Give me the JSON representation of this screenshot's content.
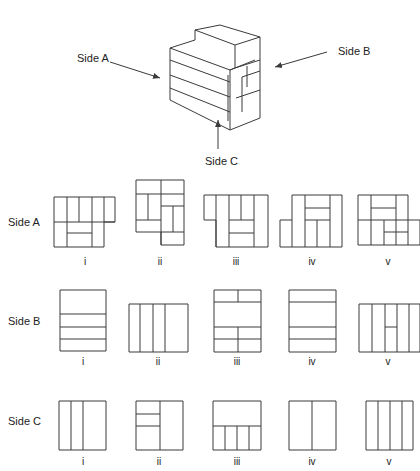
{
  "diagram": {
    "cube": {
      "labels": [
        {
          "id": "side-a",
          "text": "Side A",
          "x": 77,
          "y": 62
        },
        {
          "id": "side-b",
          "text": "Side B",
          "x": 338,
          "y": 55
        },
        {
          "id": "side-c",
          "text": "Side C",
          "x": 205,
          "y": 165
        }
      ],
      "arrows": [
        {
          "id": "arrow-side-a",
          "x1": 110,
          "y1": 62,
          "x2": 160,
          "y2": 78
        },
        {
          "id": "arrow-side-b",
          "x1": 327,
          "y1": 52,
          "x2": 275,
          "y2": 67
        },
        {
          "id": "arrow-side-c",
          "x1": 218,
          "y1": 149,
          "x2": 218,
          "y2": 120
        }
      ],
      "lines": [
        [
          170,
          48,
          230,
          70
        ],
        [
          230,
          70,
          230,
          130
        ],
        [
          170,
          48,
          170,
          100
        ],
        [
          170,
          100,
          230,
          130
        ],
        [
          170,
          60,
          230,
          82
        ],
        [
          170,
          75,
          230,
          97
        ],
        [
          170,
          88,
          230,
          112
        ],
        [
          230,
          70,
          255,
          60
        ],
        [
          230,
          130,
          260,
          118
        ],
        [
          260,
          118,
          260,
          37
        ],
        [
          170,
          48,
          195,
          40
        ],
        [
          195,
          40,
          195,
          30
        ],
        [
          195,
          30,
          220,
          25
        ],
        [
          220,
          25,
          260,
          37
        ],
        [
          195,
          30,
          235,
          45
        ],
        [
          235,
          45,
          260,
          37
        ],
        [
          235,
          45,
          235,
          68
        ],
        [
          230,
          70,
          235,
          68
        ],
        [
          235,
          68,
          260,
          60
        ],
        [
          242,
          77,
          260,
          71
        ],
        [
          236,
          98,
          260,
          90
        ],
        [
          247,
          66,
          247,
          87
        ],
        [
          242,
          77,
          242,
          112
        ],
        [
          228,
          121,
          228,
          75
        ]
      ]
    },
    "rows": [
      {
        "label": "Side A",
        "label_x": 8,
        "label_y": 226,
        "options": [
          {
            "numeral": "i",
            "numeral_x": 85,
            "numeral_y": 265,
            "polygon": [
              [
                54,
                197
              ],
              [
                115,
                197
              ],
              [
                115,
                222
              ],
              [
                104,
                222
              ],
              [
                104,
                247
              ],
              [
                54,
                247
              ]
            ],
            "lines": [
              [
                67,
                197,
                67,
                247
              ],
              [
                79,
                197,
                79,
                222
              ],
              [
                92,
                197,
                92,
                247
              ],
              [
                104,
                197,
                104,
                222
              ],
              [
                54,
                222,
                115,
                222
              ],
              [
                67,
                233,
                92,
                233
              ]
            ]
          },
          {
            "numeral": "ii",
            "numeral_x": 160,
            "numeral_y": 265,
            "polygon": [
              [
                136,
                180
              ],
              [
                184,
                180
              ],
              [
                184,
                245
              ],
              [
                161,
                245
              ],
              [
                161,
                232
              ],
              [
                136,
                232
              ]
            ],
            "lines": [
              [
                161,
                180,
                161,
                245
              ],
              [
                136,
                194,
                184,
                194
              ],
              [
                161,
                206,
                184,
                206
              ],
              [
                136,
                220,
                161,
                220
              ],
              [
                161,
                232,
                184,
                232
              ],
              [
                148,
                194,
                148,
                220
              ],
              [
                173,
                206,
                173,
                232
              ]
            ]
          },
          {
            "numeral": "iii",
            "numeral_x": 236,
            "numeral_y": 265,
            "polygon": [
              [
                204,
                195
              ],
              [
                268,
                195
              ],
              [
                268,
                247
              ],
              [
                216,
                247
              ],
              [
                216,
                220
              ],
              [
                204,
                220
              ]
            ],
            "lines": [
              [
                216,
                195,
                216,
                247
              ],
              [
                229,
                195,
                229,
                247
              ],
              [
                241,
                195,
                241,
                220
              ],
              [
                254,
                195,
                254,
                247
              ],
              [
                229,
                220,
                254,
                220
              ],
              [
                229,
                233,
                254,
                233
              ]
            ]
          },
          {
            "numeral": "iv",
            "numeral_x": 312,
            "numeral_y": 265,
            "polygon": [
              [
                280,
                220
              ],
              [
                292,
                220
              ],
              [
                292,
                195
              ],
              [
                342,
                195
              ],
              [
                342,
                247
              ],
              [
                280,
                247
              ]
            ],
            "lines": [
              [
                305,
                195,
                305,
                247
              ],
              [
                330,
                195,
                330,
                247
              ],
              [
                305,
                208,
                330,
                208
              ],
              [
                305,
                220,
                330,
                220
              ],
              [
                317,
                220,
                317,
                247
              ],
              [
                292,
                220,
                292,
                247
              ]
            ]
          },
          {
            "numeral": "v",
            "numeral_x": 388,
            "numeral_y": 265,
            "polygon": [
              [
                358,
                195
              ],
              [
                408,
                195
              ],
              [
                408,
                220
              ],
              [
                420,
                220
              ],
              [
                420,
                245
              ],
              [
                358,
                245
              ]
            ],
            "lines": [
              [
                358,
                220,
                408,
                220
              ],
              [
                371,
                195,
                371,
                245
              ],
              [
                396,
                195,
                396,
                245
              ],
              [
                371,
                208,
                396,
                208
              ],
              [
                384,
                220,
                384,
                245
              ],
              [
                384,
                232,
                408,
                232
              ],
              [
                408,
                220,
                408,
                245
              ]
            ]
          }
        ]
      },
      {
        "label": "Side B",
        "label_x": 8,
        "label_y": 325,
        "options": [
          {
            "numeral": "i",
            "numeral_x": 83,
            "numeral_y": 365,
            "polygon": [
              [
                60,
                290
              ],
              [
                106,
                290
              ],
              [
                106,
                351
              ],
              [
                60,
                351
              ]
            ],
            "lines": [
              [
                60,
                314,
                106,
                314
              ],
              [
                60,
                327,
                106,
                327
              ],
              [
                60,
                339,
                106,
                339
              ]
            ]
          },
          {
            "numeral": "ii",
            "numeral_x": 158,
            "numeral_y": 365,
            "polygon": [
              [
                129,
                304
              ],
              [
                188,
                304
              ],
              [
                188,
                352
              ],
              [
                129,
                352
              ]
            ],
            "lines": [
              [
                140,
                304,
                140,
                352
              ],
              [
                153,
                304,
                153,
                352
              ],
              [
                165,
                304,
                165,
                352
              ]
            ]
          },
          {
            "numeral": "iii",
            "numeral_x": 237,
            "numeral_y": 365,
            "polygon": [
              [
                214,
                290
              ],
              [
                261,
                290
              ],
              [
                261,
                352
              ],
              [
                214,
                352
              ]
            ],
            "lines": [
              [
                214,
                302,
                261,
                302
              ],
              [
                238,
                290,
                238,
                302
              ],
              [
                214,
                327,
                261,
                327
              ],
              [
                214,
                339,
                261,
                339
              ],
              [
                238,
                327,
                238,
                352
              ]
            ]
          },
          {
            "numeral": "iv",
            "numeral_x": 312,
            "numeral_y": 365,
            "polygon": [
              [
                289,
                290
              ],
              [
                336,
                290
              ],
              [
                336,
                352
              ],
              [
                289,
                352
              ]
            ],
            "lines": [
              [
                289,
                302,
                336,
                302
              ],
              [
                289,
                327,
                336,
                327
              ],
              [
                289,
                339,
                336,
                339
              ]
            ]
          },
          {
            "numeral": "v",
            "numeral_x": 388,
            "numeral_y": 365,
            "polygon": [
              [
                359,
                304
              ],
              [
                420,
                304
              ],
              [
                420,
                352
              ],
              [
                359,
                352
              ]
            ],
            "lines": [
              [
                372,
                304,
                372,
                352
              ],
              [
                385,
                304,
                385,
                352
              ],
              [
                397,
                304,
                397,
                352
              ],
              [
                409,
                304,
                409,
                352
              ],
              [
                385,
                327,
                397,
                327
              ]
            ]
          }
        ]
      },
      {
        "label": "Side C",
        "label_x": 8,
        "label_y": 425,
        "options": [
          {
            "numeral": "i",
            "numeral_x": 83,
            "numeral_y": 465,
            "polygon": [
              [
                59,
                401
              ],
              [
                106,
                401
              ],
              [
                106,
                450
              ],
              [
                59,
                450
              ]
            ],
            "lines": [
              [
                71,
                401,
                71,
                450
              ],
              [
                83,
                401,
                83,
                450
              ]
            ]
          },
          {
            "numeral": "ii",
            "numeral_x": 159,
            "numeral_y": 465,
            "polygon": [
              [
                136,
                401
              ],
              [
                183,
                401
              ],
              [
                183,
                450
              ],
              [
                136,
                450
              ]
            ],
            "lines": [
              [
                160,
                401,
                160,
                450
              ],
              [
                136,
                414,
                160,
                414
              ],
              [
                136,
                426,
                160,
                426
              ]
            ]
          },
          {
            "numeral": "iii",
            "numeral_x": 237,
            "numeral_y": 465,
            "polygon": [
              [
                213,
                401
              ],
              [
                261,
                401
              ],
              [
                261,
                450
              ],
              [
                213,
                450
              ]
            ],
            "lines": [
              [
                213,
                426,
                261,
                426
              ],
              [
                225,
                426,
                225,
                450
              ],
              [
                237,
                426,
                237,
                450
              ],
              [
                249,
                426,
                249,
                450
              ]
            ]
          },
          {
            "numeral": "iv",
            "numeral_x": 312,
            "numeral_y": 465,
            "polygon": [
              [
                289,
                401
              ],
              [
                336,
                401
              ],
              [
                336,
                450
              ],
              [
                289,
                450
              ]
            ],
            "lines": [
              [
                312,
                401,
                312,
                450
              ]
            ]
          },
          {
            "numeral": "v",
            "numeral_x": 389,
            "numeral_y": 465,
            "polygon": [
              [
                366,
                401
              ],
              [
                413,
                401
              ],
              [
                413,
                450
              ],
              [
                366,
                450
              ]
            ],
            "lines": [
              [
                378,
                401,
                378,
                450
              ],
              [
                390,
                401,
                390,
                450
              ],
              [
                402,
                401,
                402,
                450
              ]
            ]
          }
        ]
      }
    ]
  }
}
